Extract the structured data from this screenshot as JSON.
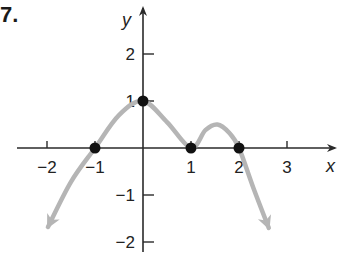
{
  "problem": {
    "number": "7."
  },
  "chart_data": {
    "type": "line",
    "title": "",
    "xlabel": "x",
    "ylabel": "y",
    "xlim": [
      -2.6,
      4.0
    ],
    "ylim": [
      -2.2,
      2.9
    ],
    "grid": false,
    "x_ticks": [
      -2,
      -1,
      1,
      2,
      3
    ],
    "x_tick_labels": [
      "−2",
      "−1",
      "1",
      "2",
      "3"
    ],
    "y_ticks": [
      2,
      1,
      -1,
      -2
    ],
    "y_tick_labels": [
      "2",
      "1",
      "−1",
      "−2"
    ],
    "series": [
      {
        "name": "f(x)",
        "color": "#b5b5b5",
        "arrows_at_ends": true,
        "x": [
          -1.98,
          -1.5,
          -1.0,
          -0.5,
          0.0,
          0.5,
          1.0,
          1.3,
          1.55,
          1.8,
          2.0,
          2.3,
          2.62
        ],
        "y": [
          -1.68,
          -0.72,
          0.0,
          0.7,
          1.0,
          0.55,
          0.0,
          0.38,
          0.5,
          0.32,
          0.0,
          -0.85,
          -1.7
        ]
      }
    ],
    "marked_points": [
      {
        "x": -1,
        "y": 0,
        "label": ""
      },
      {
        "x": 0,
        "y": 1,
        "label": ""
      },
      {
        "x": 1,
        "y": 0,
        "label": ""
      },
      {
        "x": 2,
        "y": 0,
        "label": ""
      }
    ],
    "colors": {
      "axis": "#2a2a2a",
      "curve": "#b5b5b5",
      "points": "#111111"
    }
  }
}
